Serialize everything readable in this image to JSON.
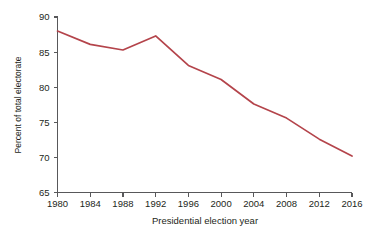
{
  "chart_data": {
    "type": "line",
    "title": "",
    "xlabel": "Presidential election year",
    "ylabel": "Percent of total electorate",
    "xlim": [
      1980,
      2016
    ],
    "ylim": [
      65,
      90
    ],
    "grid": false,
    "legend": "none",
    "line_color": "#b4444b",
    "axis_color": "#58585a",
    "text_color": "#231f20",
    "x_ticks": [
      1980,
      1984,
      1988,
      1992,
      1996,
      2000,
      2004,
      2008,
      2012,
      2016
    ],
    "x_tick_labels": [
      "1980",
      "1984",
      "1988",
      "1992",
      "1996",
      "2000",
      "2004",
      "2008",
      "2012",
      "2016"
    ],
    "y_ticks": [
      65,
      70,
      75,
      80,
      85,
      90
    ],
    "y_tick_labels": [
      "65",
      "70",
      "75",
      "80",
      "85",
      "90"
    ],
    "categories": [
      1980,
      1984,
      1988,
      1992,
      1996,
      2000,
      2004,
      2008,
      2012,
      2016
    ],
    "values": [
      88.0,
      86.1,
      85.3,
      87.3,
      83.1,
      81.1,
      77.6,
      75.6,
      72.6,
      70.2
    ],
    "series": [
      {
        "name": "Percent of total electorate",
        "values": [
          88.0,
          86.1,
          85.3,
          87.3,
          83.1,
          81.1,
          77.6,
          75.6,
          72.6,
          70.2
        ]
      }
    ],
    "annotations": []
  }
}
